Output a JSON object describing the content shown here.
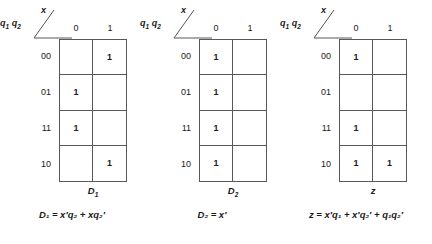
{
  "figure": {
    "title": "Karnaugh maps for D1, D2 and z",
    "row_variable_label_q1": "q",
    "row_variable_sub_q1": "1",
    "row_variable_label_q2": "q",
    "row_variable_sub_q2": "2",
    "column_variable_label": "x",
    "column_headers": [
      "0",
      "1"
    ],
    "row_headers": [
      "00",
      "01",
      "11",
      "10"
    ],
    "line_color": "#58585a"
  },
  "maps": [
    {
      "id": "D1",
      "name_main": "D",
      "name_sub": "1",
      "cells": [
        [
          "",
          "1"
        ],
        [
          "1",
          ""
        ],
        [
          "1",
          ""
        ],
        [
          "",
          "1"
        ]
      ],
      "equation": "D₁ = x′q₂ + xq₂′",
      "equation_plain": "D1 = x'q2 + xq2'"
    },
    {
      "id": "D2",
      "name_main": "D",
      "name_sub": "2",
      "cells": [
        [
          "1",
          ""
        ],
        [
          "1",
          ""
        ],
        [
          "1",
          ""
        ],
        [
          "1",
          ""
        ]
      ],
      "equation": "D₂ = x′",
      "equation_plain": "D2 = x'"
    },
    {
      "id": "z",
      "name_main": "z",
      "name_sub": "",
      "cells": [
        [
          "1",
          ""
        ],
        [
          "",
          ""
        ],
        [
          "1",
          ""
        ],
        [
          "1",
          "1"
        ]
      ],
      "equation": "z = x′q₁ + x′q₂′ + q₁q₂′",
      "equation_plain": "z = x'q1 + x'q2' + q1q2'"
    }
  ]
}
